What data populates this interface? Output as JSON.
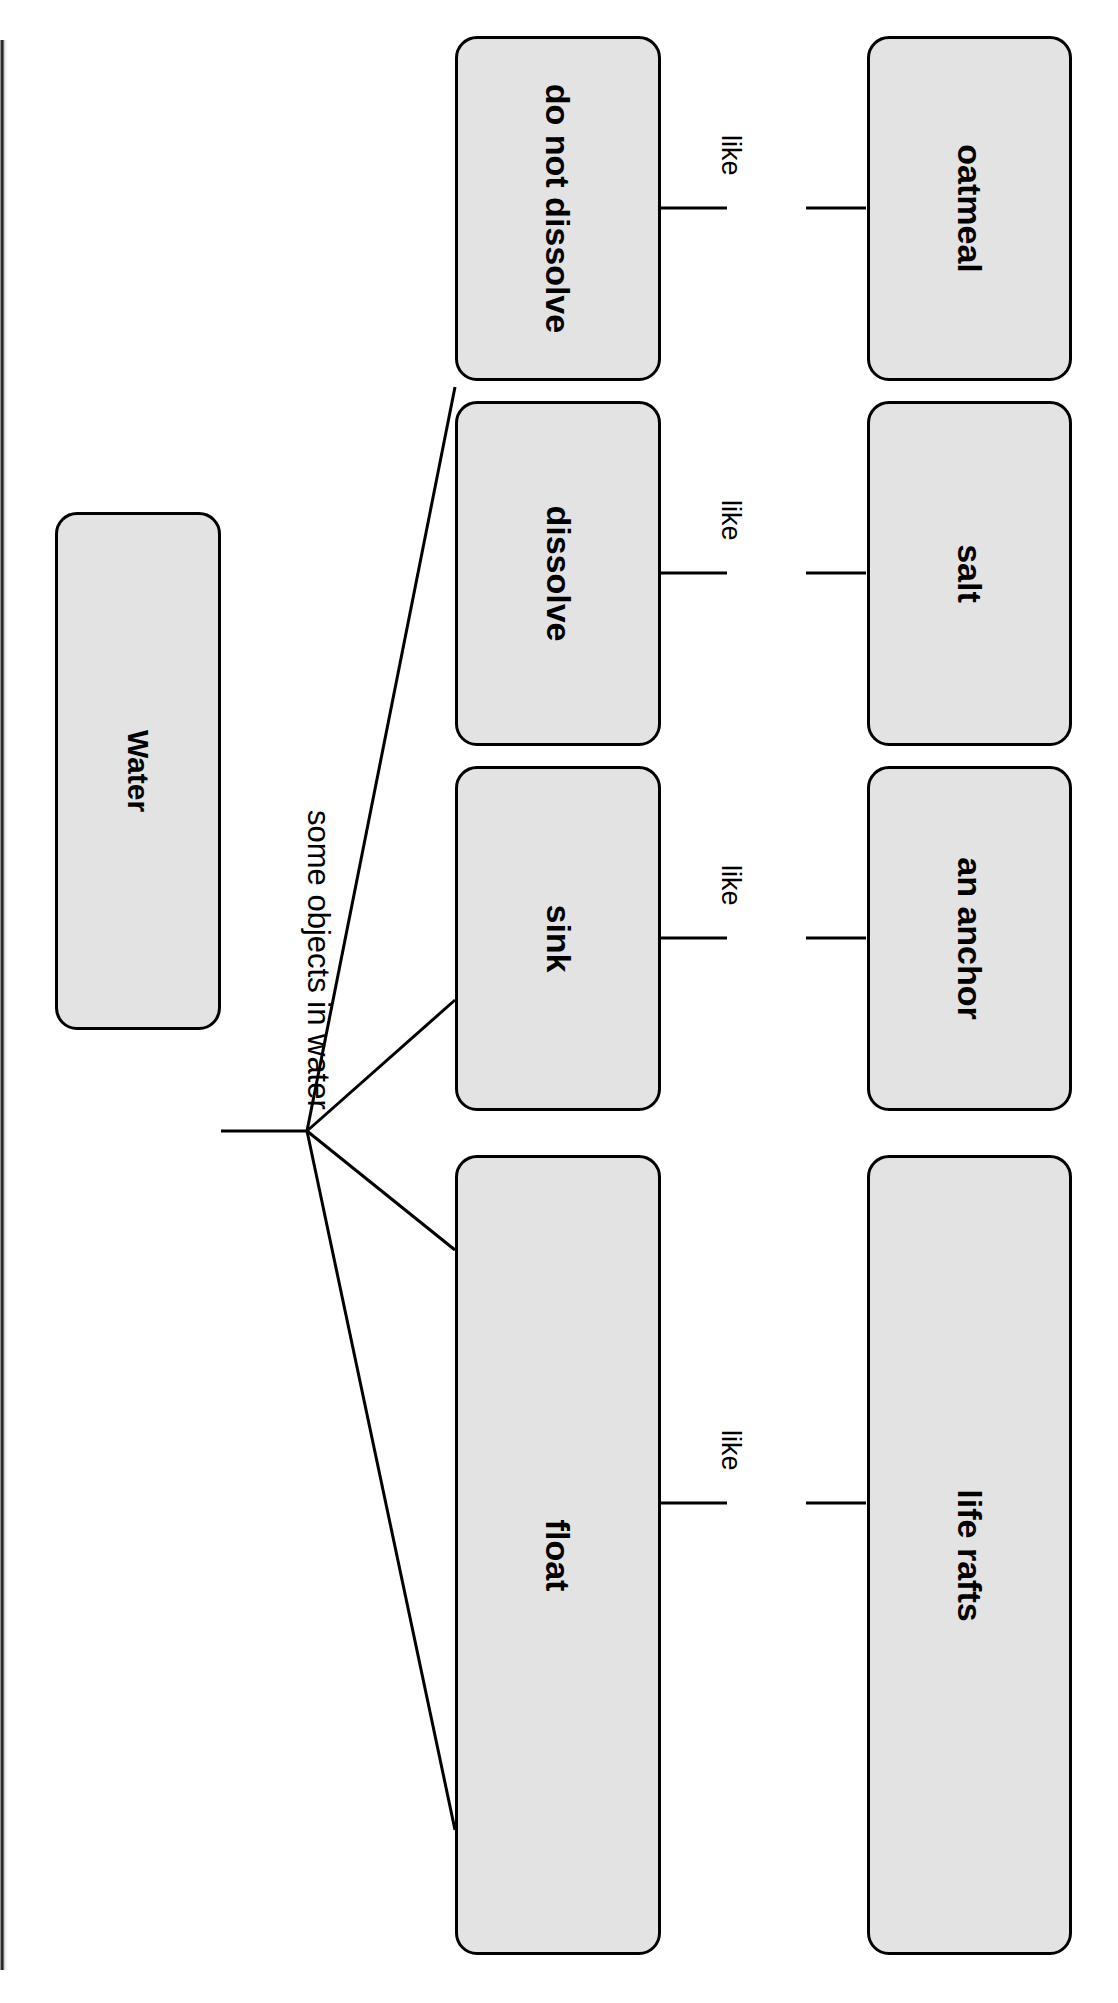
{
  "diagram": {
    "title_node": "Water",
    "root_edge_label": "some objects in water",
    "branches": [
      {
        "concept": "do not dissolve",
        "edge_label": "like",
        "example": "oatmeal"
      },
      {
        "concept": "dissolve",
        "edge_label": "like",
        "example": "salt"
      },
      {
        "concept": "sink",
        "edge_label": "like",
        "example": "an anchor"
      },
      {
        "concept": "float",
        "edge_label": "like",
        "example": "life rafts"
      }
    ],
    "colors": {
      "node_fill": "#e3e3e3",
      "node_border": "#000000",
      "text": "#000000",
      "page_background": "#ffffff"
    }
  }
}
